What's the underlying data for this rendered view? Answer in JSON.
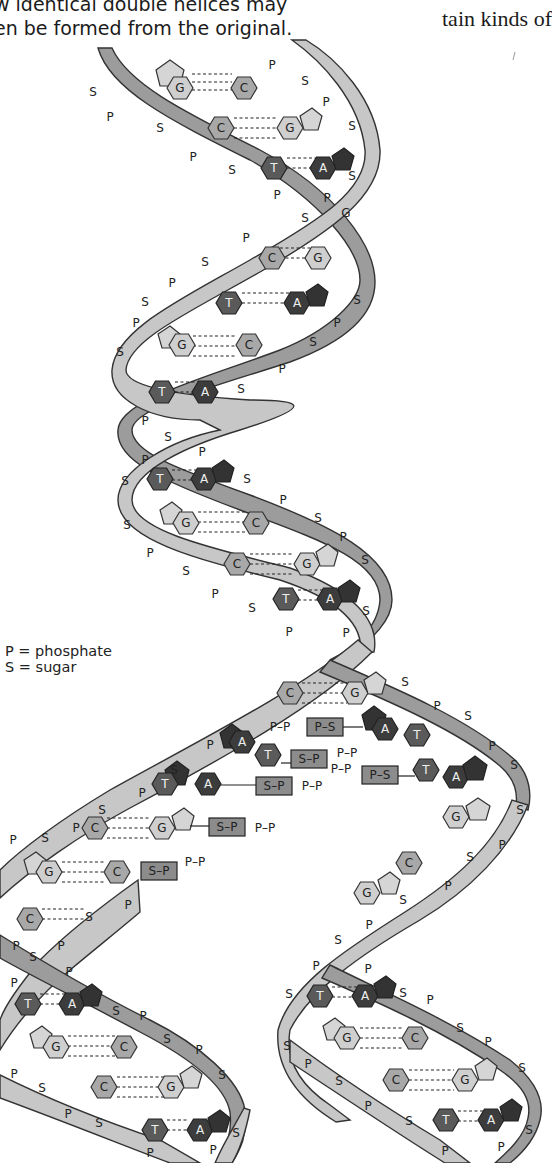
{
  "page": {
    "caption_left_line1": "w identical double helices may",
    "caption_left_line2": "en be formed from the original.",
    "caption_right": "tain kinds of"
  },
  "legend": {
    "phosphate": "P = phosphate",
    "sugar": "S = sugar"
  },
  "labels": {
    "phosphate": "P",
    "sugar": "S",
    "guanine": "G",
    "cytosine": "C",
    "thymine": "T",
    "adenine": "A",
    "free_nucleotide_tail": "P–P",
    "box_sp": "S–P",
    "box_ps": "P–S"
  },
  "colors": {
    "strand_light": "#c7c7c7",
    "strand_dark": "#9c9c9c",
    "guanine": "#cfcfcf",
    "cytosine": "#a8a8a8",
    "thymine": "#5a5a5a",
    "adenine": "#3c3c3c",
    "nucleotide_box": "#8c8c8c"
  },
  "diagram": {
    "parent_helix_base_pairs": [
      "G–C",
      "C–G",
      "T–A",
      "C–G",
      "T–A",
      "G–C",
      "T–A",
      "T–A",
      "G–C",
      "C–G",
      "T–A",
      "C–G"
    ],
    "free_nucleotides": [
      "A (P–P–P–S)",
      "T (S–P–P–P)",
      "A (S–P–P–P)",
      "T (P–P–P–S)",
      "G (S–P–P–P)",
      "C (S–P–P–P)"
    ],
    "left_daughter_base_pairs": [
      "C–G",
      "G–C",
      "C–G",
      "T–A",
      "G–C",
      "C–G",
      "T–A"
    ],
    "right_daughter_base_pairs": [
      "G",
      "C",
      "T–A",
      "G–C",
      "C–G",
      "T–A"
    ]
  }
}
